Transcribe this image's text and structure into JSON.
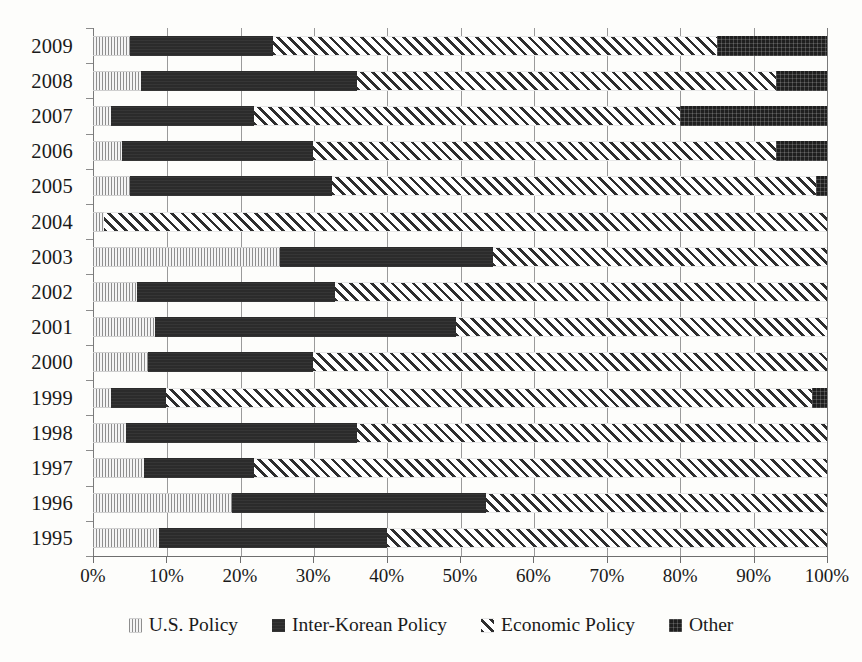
{
  "chart_data": {
    "type": "bar",
    "orientation": "horizontal",
    "stacked": true,
    "normalized": true,
    "title": "",
    "subtitle": "",
    "xlabel": "",
    "ylabel": "",
    "xlim": [
      0,
      100
    ],
    "grid": true,
    "legend_position": "bottom",
    "categories": [
      "2009",
      "2008",
      "2007",
      "2006",
      "2005",
      "2004",
      "2003",
      "2002",
      "2001",
      "2000",
      "1999",
      "1998",
      "1997",
      "1996",
      "1995"
    ],
    "xtick_labels": [
      "0%",
      "10%",
      "20%",
      "30%",
      "40%",
      "50%",
      "60%",
      "70%",
      "80%",
      "90%",
      "100%"
    ],
    "xtick_values": [
      0,
      10,
      20,
      30,
      40,
      50,
      60,
      70,
      80,
      90,
      100
    ],
    "series": [
      {
        "name": "U.S. Policy",
        "key": "us",
        "pattern": "light-stipple",
        "color": "#8e8e8e",
        "values": [
          5.0,
          6.5,
          2.5,
          4.0,
          5.0,
          1.5,
          25.5,
          6.0,
          8.5,
          7.5,
          2.5,
          4.5,
          7.0,
          19.0,
          9.0
        ]
      },
      {
        "name": "Inter-Korean Policy",
        "key": "ik",
        "pattern": "solid-black",
        "color": "#2b2b2b",
        "values": [
          19.5,
          29.5,
          19.5,
          26.0,
          27.5,
          0.0,
          29.0,
          27.0,
          41.0,
          22.5,
          7.5,
          31.5,
          15.0,
          34.5,
          31.0
        ]
      },
      {
        "name": "Economic Policy",
        "key": "ec",
        "pattern": "diagonal-hatch",
        "color": "#2e2e2e",
        "values": [
          60.5,
          57.0,
          58.0,
          63.0,
          66.0,
          98.5,
          45.5,
          67.0,
          50.5,
          70.0,
          88.0,
          64.0,
          78.0,
          46.5,
          60.0
        ]
      },
      {
        "name": "Other",
        "key": "ot",
        "pattern": "dark-speckle",
        "color": "#1f1f1f",
        "values": [
          15.0,
          7.0,
          20.0,
          7.0,
          1.5,
          0.0,
          0.0,
          0.0,
          0.0,
          0.0,
          2.0,
          0.0,
          0.0,
          0.0,
          0.0
        ]
      }
    ]
  },
  "legend": {
    "entries": [
      {
        "label": "U.S. Policy",
        "key": "us"
      },
      {
        "label": "Inter-Korean Policy",
        "key": "ik"
      },
      {
        "label": "Economic Policy",
        "key": "ec"
      },
      {
        "label": "Other",
        "key": "ot"
      }
    ]
  }
}
